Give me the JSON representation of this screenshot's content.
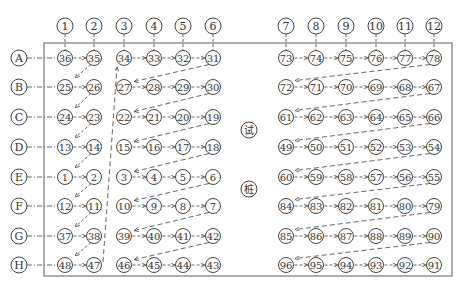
{
  "frame": {
    "left": 44,
    "top": 43,
    "right": 452,
    "bottom": 276,
    "stroke": "#777777"
  },
  "colors": {
    "line": "#555555",
    "circle": "#444444",
    "text": "#333333"
  },
  "column_headers": [
    {
      "label": "1",
      "x": 65
    },
    {
      "label": "2",
      "x": 94
    },
    {
      "label": "3",
      "x": 124
    },
    {
      "label": "4",
      "x": 154
    },
    {
      "label": "5",
      "x": 183
    },
    {
      "label": "6",
      "x": 213
    },
    {
      "label": "7",
      "x": 286
    },
    {
      "label": "8",
      "x": 316
    },
    {
      "label": "9",
      "x": 346
    },
    {
      "label": "10",
      "x": 376
    },
    {
      "label": "11",
      "x": 405
    },
    {
      "label": "12",
      "x": 434
    }
  ],
  "column_header_y": 26,
  "row_headers": [
    {
      "label": "A",
      "y": 58
    },
    {
      "label": "B",
      "y": 87
    },
    {
      "label": "C",
      "y": 117
    },
    {
      "label": "D",
      "y": 147
    },
    {
      "label": "E",
      "y": 177
    },
    {
      "label": "F",
      "y": 206
    },
    {
      "label": "G",
      "y": 236
    },
    {
      "label": "H",
      "y": 265
    }
  ],
  "row_header_x": 19,
  "test_pile_labels": [
    {
      "label": "试",
      "x": 249,
      "y": 130
    },
    {
      "label": "桩",
      "x": 249,
      "y": 189
    }
  ],
  "grid": {
    "left_block_pair": [
      [
        "36",
        "35"
      ],
      [
        "25",
        "26"
      ],
      [
        "24",
        "23"
      ],
      [
        "13",
        "14"
      ],
      [
        "1",
        "2"
      ],
      [
        "12",
        "11"
      ],
      [
        "37",
        "38"
      ],
      [
        "48",
        "47"
      ]
    ],
    "left_block_main": [
      [
        "34",
        "33",
        "32",
        "31"
      ],
      [
        "27",
        "28",
        "29",
        "30"
      ],
      [
        "22",
        "21",
        "20",
        "19"
      ],
      [
        "15",
        "16",
        "17",
        "18"
      ],
      [
        "3",
        "4",
        "5",
        "6"
      ],
      [
        "10",
        "9",
        "8",
        "7"
      ],
      [
        "39",
        "40",
        "41",
        "42"
      ],
      [
        "46",
        "45",
        "44",
        "43"
      ]
    ],
    "right_block": [
      [
        "73",
        "74",
        "75",
        "76",
        "77",
        "78"
      ],
      [
        "72",
        "71",
        "70",
        "69",
        "68",
        "67"
      ],
      [
        "61",
        "62",
        "63",
        "64",
        "65",
        "66"
      ],
      [
        "49",
        "50",
        "51",
        "52",
        "53",
        "54"
      ],
      [
        "60",
        "59",
        "58",
        "57",
        "56",
        "55"
      ],
      [
        "84",
        "83",
        "82",
        "81",
        "80",
        "79"
      ],
      [
        "85",
        "86",
        "87",
        "88",
        "89",
        "90"
      ],
      [
        "96",
        "95",
        "94",
        "93",
        "92",
        "91"
      ]
    ]
  },
  "notes": {
    "row_flow": "Within every row arrows point left-to-right between adjacent nodes",
    "return_arrows": "Dashed diagonal arrows run from the rightmost node of each row back to the leftmost node of the next row",
    "long_arrow": "Dashed arrow from node 47 (row H) up to node 34 (row A)"
  }
}
